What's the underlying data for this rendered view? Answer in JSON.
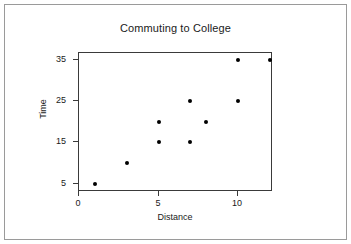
{
  "chart_data": {
    "type": "scatter",
    "title": "Commuting to College",
    "xlabel": "Distance",
    "ylabel": "Time",
    "xlim": [
      0,
      12.2
    ],
    "ylim": [
      3,
      36.6
    ],
    "xticks": [
      0,
      5,
      10
    ],
    "xtick_labels": [
      "0",
      "5",
      "10"
    ],
    "yticks": [
      5,
      15,
      25,
      35
    ],
    "ytick_labels": [
      "5",
      "15",
      "25",
      "35"
    ],
    "grid": false,
    "legend": null,
    "marker": "filled-circle",
    "marker_color": "#000000",
    "points": [
      {
        "x": 1,
        "y": 5
      },
      {
        "x": 3,
        "y": 10
      },
      {
        "x": 5,
        "y": 15
      },
      {
        "x": 5,
        "y": 20
      },
      {
        "x": 7,
        "y": 15
      },
      {
        "x": 7,
        "y": 25
      },
      {
        "x": 8,
        "y": 20
      },
      {
        "x": 10,
        "y": 25
      },
      {
        "x": 10,
        "y": 35
      },
      {
        "x": 12,
        "y": 35
      }
    ]
  },
  "figure": {
    "background": "#ffffff",
    "frame_color": "#9a9a9a",
    "axes_color": "#3a3a3a",
    "text_color": "#1a1a1a"
  }
}
